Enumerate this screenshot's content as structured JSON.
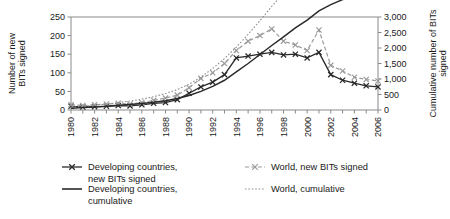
{
  "chart_data": {
    "type": "line",
    "title": "",
    "xlabel": "",
    "ylabel": "Number of new BITs signed",
    "y2label": "Cumulative number of BITs signed",
    "x": [
      1980,
      1981,
      1982,
      1983,
      1984,
      1985,
      1986,
      1987,
      1988,
      1989,
      1990,
      1991,
      1992,
      1993,
      1994,
      1995,
      1996,
      1997,
      1998,
      1999,
      2000,
      2001,
      2002,
      2003,
      2004,
      2005,
      2006
    ],
    "tick_labels_x": [
      "1980",
      "1982",
      "1984",
      "1986",
      "1988",
      "1990",
      "1992",
      "1994",
      "1996",
      "1998",
      "2000",
      "2002",
      "2004",
      "2006"
    ],
    "tick_labels_y": [
      "0",
      "50",
      "100",
      "150",
      "200",
      "250"
    ],
    "tick_labels_y2": [
      "0",
      "500",
      "1,000",
      "1,500",
      "2,000",
      "2,500",
      "3,000"
    ],
    "ylim": [
      0,
      250
    ],
    "y2lim": [
      0,
      3000
    ],
    "xlim": [
      1980,
      2006
    ],
    "grid": false,
    "legend_position": "bottom",
    "series": [
      {
        "name": "Developing countries, new BITs signed",
        "axis": "left",
        "style": "solid-with-x-markers",
        "color": "#2a2a2a",
        "values": [
          10,
          8,
          9,
          10,
          12,
          11,
          14,
          18,
          20,
          28,
          45,
          62,
          75,
          95,
          140,
          145,
          150,
          155,
          148,
          150,
          140,
          155,
          95,
          80,
          72,
          65,
          62
        ]
      },
      {
        "name": "World, new BITs signed",
        "axis": "left",
        "style": "dashed-with-x-markers",
        "color": "#9a9a9a",
        "values": [
          14,
          12,
          14,
          16,
          18,
          16,
          20,
          26,
          32,
          40,
          60,
          85,
          100,
          125,
          160,
          185,
          200,
          218,
          185,
          175,
          160,
          215,
          120,
          105,
          88,
          82,
          78
        ]
      },
      {
        "name": "Developing countries, cumulative",
        "axis": "right",
        "style": "solid",
        "color": "#2a2a2a",
        "values": [
          60,
          80,
          100,
          120,
          150,
          175,
          210,
          250,
          300,
          370,
          470,
          600,
          760,
          960,
          1230,
          1500,
          1790,
          2080,
          2360,
          2650,
          2900,
          3200,
          3400,
          3560,
          3700,
          3820,
          3940
        ]
      },
      {
        "name": "World, cumulative",
        "axis": "right",
        "style": "dotted",
        "color": "#8f8f8f",
        "values": [
          90,
          120,
          150,
          190,
          240,
          290,
          350,
          430,
          530,
          660,
          830,
          1060,
          1340,
          1660,
          2030,
          2440,
          2880,
          3340,
          3760,
          4160,
          4520,
          4940,
          5240,
          5480,
          5690,
          5870,
          6030
        ]
      }
    ],
    "legend": [
      {
        "label": "Developing countries,",
        "label2": "new BITs signed",
        "marker": "solid-x"
      },
      {
        "label": "World, new BITs signed",
        "label2": "",
        "marker": "dashed-x"
      },
      {
        "label": "Developing countries,",
        "label2": "cumulative",
        "marker": "solid-line"
      },
      {
        "label": "World, cumulative",
        "label2": "",
        "marker": "dotted-line"
      }
    ]
  }
}
